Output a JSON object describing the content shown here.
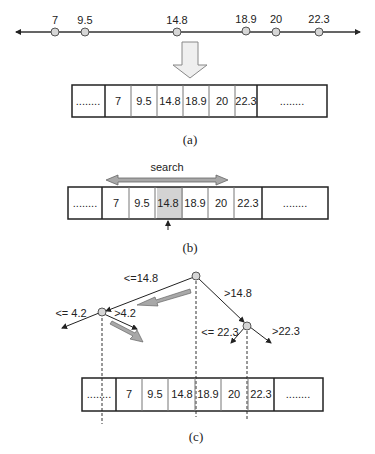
{
  "number_line": {
    "points": [
      {
        "label": "7",
        "x": 55
      },
      {
        "label": "9.5",
        "x": 85
      },
      {
        "label": "14.8",
        "x": 177
      },
      {
        "label": "18.9",
        "x": 246
      },
      {
        "label": "20",
        "x": 276
      },
      {
        "label": "22.3",
        "x": 320
      }
    ]
  },
  "array_a": {
    "cells": [
      "........",
      "7",
      "9.5",
      "14.8",
      "18.9",
      "20",
      "22.3",
      "........"
    ],
    "caption": "(a)"
  },
  "array_b": {
    "search_label": "search",
    "cells": [
      "........",
      "7",
      "9.5",
      "14.8",
      "18.9",
      "20",
      "22.3",
      "........"
    ],
    "highlighted": "14.8",
    "highlight_color": "#d3d3d3",
    "caption": "(b)"
  },
  "tree_c": {
    "root_left_label": "<=14.8",
    "root_right_label": ">14.8",
    "left_node_left_label": "<= 4.2",
    "left_node_right_label": ">4.2",
    "right_node_left_label": "<= 22.3",
    "right_node_right_label": ">22.3",
    "cells": [
      "........",
      "7",
      "9.5",
      "14.8",
      "18.9",
      "20",
      "22.3",
      "........"
    ],
    "caption": "(c)"
  },
  "colors": {
    "node_fill": "#d6d6d6",
    "arrow_fill": "#a8a8a8",
    "line": "#222222"
  }
}
